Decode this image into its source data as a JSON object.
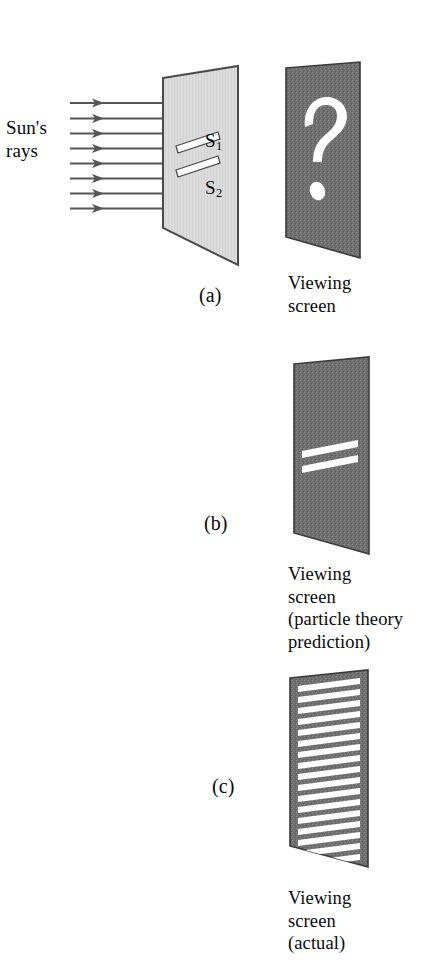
{
  "figure": {
    "background_color": "#ffffff",
    "ink_color": "#0a0a0a",
    "barrier_fill": "#dcdcdc",
    "barrier_stroke": "#4a4a4a",
    "screen_fill": "#707070",
    "screen_stroke": "#3a3a3a",
    "fringe_color": "#ffffff",
    "ray_color": "#555555"
  },
  "labels": {
    "sun_rays": "Sun's\nrays",
    "slit_1": "S",
    "slit_1_sub": "1",
    "slit_2": "S",
    "slit_2_sub": "2"
  },
  "panels": [
    {
      "letter": "(a)",
      "caption": "Viewing\nscreen",
      "screen_content": "question-mark",
      "description": "Sun's rays pass through a barrier with two slits S1 and S2 toward a viewing screen showing an unknown result"
    },
    {
      "letter": "(b)",
      "caption": "Viewing\nscreen\n(particle theory\nprediction)",
      "screen_content": "two-bright-bars",
      "bar_count": 2,
      "description": "Particle theory predicts two bright bands on the viewing screen"
    },
    {
      "letter": "(c)",
      "caption": "Viewing\nscreen\n(actual)",
      "screen_content": "interference-fringes",
      "fringe_count": 17,
      "description": "Actual result shows many alternating bright and dark interference fringes"
    }
  ],
  "rays": {
    "count": 8,
    "direction": "left-to-right",
    "arrowhead": "filled-triangle"
  }
}
